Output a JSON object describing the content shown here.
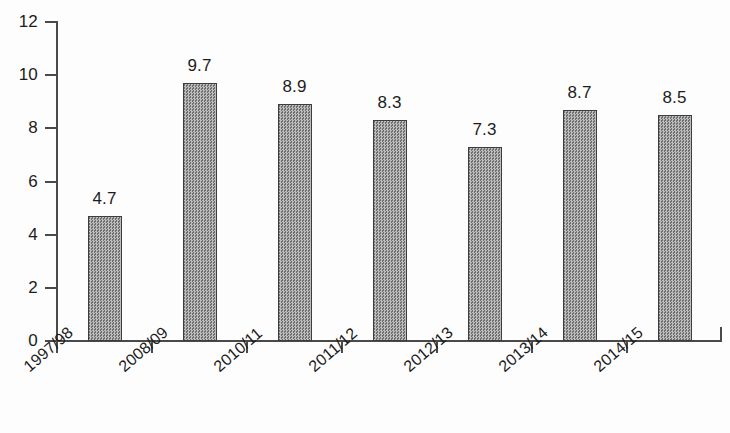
{
  "chart_data": {
    "type": "bar",
    "title": "",
    "subtitle": "",
    "xlabel": "",
    "ylabel": "",
    "categories": [
      "1997/98",
      "2008/09",
      "2010/11",
      "2011/12",
      "2012/13",
      "2013/14",
      "2014/15"
    ],
    "values": [
      4.7,
      9.7,
      8.9,
      8.3,
      7.3,
      8.7,
      8.5
    ],
    "value_labels": [
      "4.7",
      "9.7",
      "8.9",
      "8.3",
      "7.3",
      "8.7",
      "8.5"
    ],
    "ylim": [
      0,
      12
    ],
    "y_ticks": [
      0,
      2,
      4,
      6,
      8,
      10,
      12
    ],
    "y_tick_labels": [
      "0",
      "2",
      "4",
      "6",
      "8",
      "10",
      "12"
    ],
    "grid": false,
    "legend": null,
    "legend_position": "none",
    "bar_fill_color": "#9a9a9a",
    "bar_border_color": "#3d3d3d",
    "axis_color": "#4a4a4a",
    "text_color": "#1c1c1c",
    "background_color": "#fdfdfd",
    "x_label_rotation_deg": -41
  }
}
